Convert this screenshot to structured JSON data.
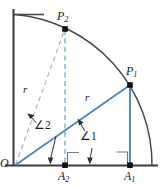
{
  "figure": {
    "colors": {
      "axis": "#3a3a3a",
      "arc": "#4a4a4a",
      "blue": "#4a87c4",
      "dashed_blue": "#7fb0d8",
      "dashed_gray": "#b9b9b9",
      "label": "#1a1a1a"
    },
    "labels": {
      "origin": "O",
      "point_1": "P",
      "point_1_sub": "1",
      "point_2": "P",
      "point_2_sub": "2",
      "foot_1": "A",
      "foot_1_sub": "1",
      "foot_2": "A",
      "foot_2_sub": "2",
      "radius_1": "r",
      "radius_2": "r",
      "angle_1": "∠1",
      "angle_2": "∠2"
    },
    "geometry": {
      "origin": [
        15,
        165
      ],
      "radius": 137,
      "point_1": [
        130,
        85
      ],
      "point_2": [
        65,
        29
      ],
      "foot_1": [
        130,
        165
      ],
      "foot_2": [
        65,
        165
      ],
      "arc_start": [
        15,
        14
      ],
      "arc_end": [
        152,
        165
      ],
      "baseline_end": [
        157,
        165
      ],
      "vertical_axis_top": [
        13,
        9
      ]
    }
  }
}
